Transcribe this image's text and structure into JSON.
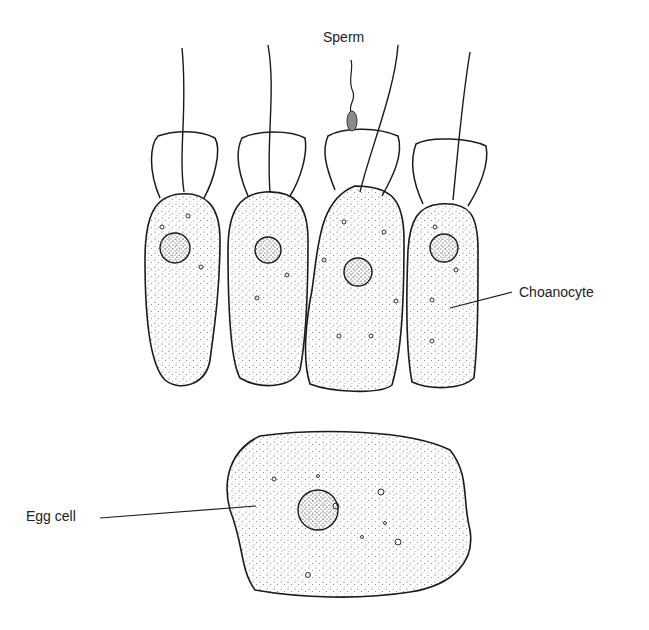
{
  "diagram": {
    "labels": {
      "sperm": "Sperm",
      "choanocyte": "Choanocyte",
      "egg_cell": "Egg cell"
    },
    "colors": {
      "outline": "#1a1a1a",
      "stipple": "#555555",
      "sperm_head": "#8a8a8a"
    }
  }
}
